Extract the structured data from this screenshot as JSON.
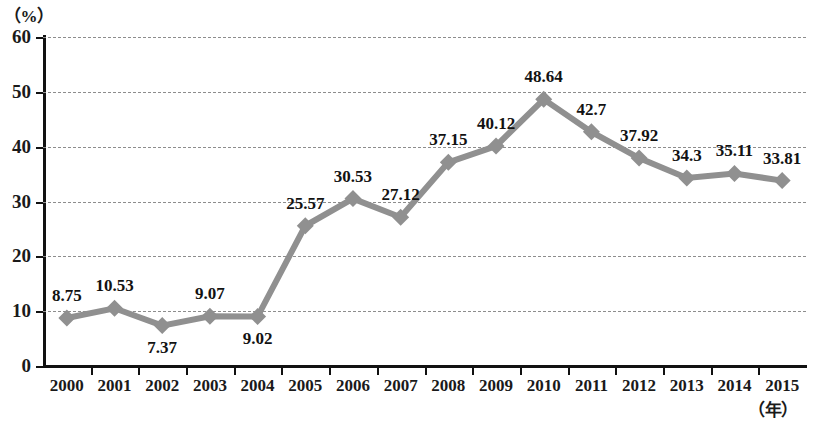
{
  "chart_data": {
    "type": "line",
    "title": "",
    "subtitle": "",
    "xlabel": "（年）",
    "ylabel": "（%）",
    "xlim": [
      2000,
      2015
    ],
    "ylim": [
      0,
      60
    ],
    "ytick_step": 10,
    "grid": true,
    "legend": "none",
    "series_color": "#909090",
    "marker": "diamond",
    "categories": [
      "2000",
      "2001",
      "2002",
      "2003",
      "2004",
      "2005",
      "2006",
      "2007",
      "2008",
      "2009",
      "2010",
      "2011",
      "2012",
      "2013",
      "2014",
      "2015"
    ],
    "values": [
      8.75,
      10.53,
      7.37,
      9.07,
      9.02,
      25.57,
      30.53,
      27.12,
      37.15,
      40.12,
      48.64,
      42.7,
      37.92,
      34.3,
      35.11,
      33.81
    ],
    "point_labels": [
      "8.75",
      "10.53",
      "7.37",
      "9.07",
      "9.02",
      "25.57",
      "30.53",
      "27.12",
      "37.15",
      "40.12",
      "48.64",
      "42.7",
      "37.92",
      "34.3",
      "35.11",
      "33.81"
    ],
    "label_positions": [
      "above",
      "above",
      "below",
      "above",
      "below",
      "above",
      "above",
      "above",
      "above",
      "above",
      "above",
      "above",
      "above",
      "above",
      "above",
      "above"
    ],
    "yticks": [
      "0",
      "10",
      "20",
      "30",
      "40",
      "50",
      "60"
    ],
    "ytick_values": [
      0,
      10,
      20,
      30,
      40,
      50,
      60
    ]
  }
}
